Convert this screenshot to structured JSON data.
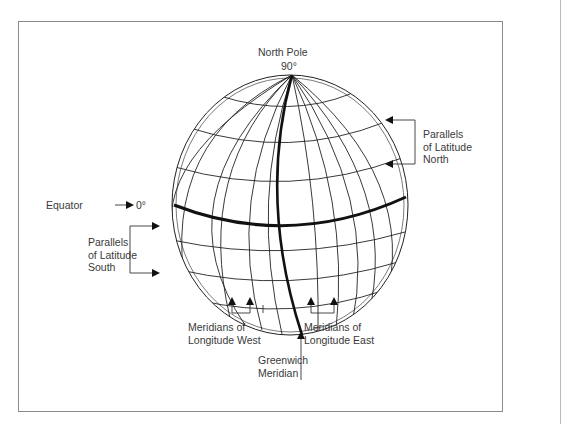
{
  "labels": {
    "north_pole": "North Pole",
    "north_pole_degree": "90°",
    "equator": "Equator",
    "equator_degree": "0°",
    "parallels_north": [
      "Parallels",
      "of Latitude",
      "North"
    ],
    "parallels_south": [
      "Parallels",
      "of Latitude",
      "South"
    ],
    "meridians_west": [
      "Meridians of",
      "Longitude West"
    ],
    "meridians_east": [
      "Meridians of",
      "Longitude East"
    ],
    "greenwich": [
      "Greenwich",
      "Meridian"
    ]
  },
  "colors": {
    "line": "#222222",
    "text": "#3a3a3a",
    "frame": "#8a8a8a"
  }
}
